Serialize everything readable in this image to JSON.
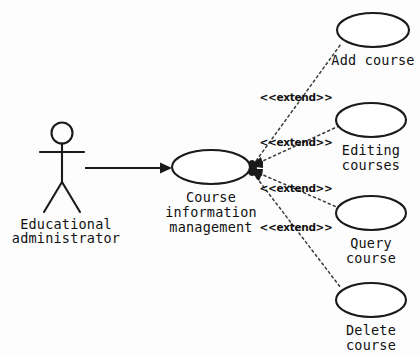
{
  "diagram": {
    "type": "uml-use-case-diagram",
    "background_color": "#fdfdfd",
    "line_color": "#1a1a1a",
    "actor": {
      "name": "educational-administrator",
      "label_line1": "Educational",
      "label_line2": "administrator",
      "x": 75,
      "y": 165
    },
    "main_use_case": {
      "name": "course-information-management",
      "label_line1": "Course",
      "label_line2": "information",
      "label_line3": "management",
      "cx": 211,
      "cy": 167,
      "rx": 39,
      "ry": 17
    },
    "extended_use_cases": [
      {
        "id": "add-course",
        "label_line1": "Add course",
        "label_line2": "",
        "cx": 373,
        "cy": 30,
        "rx": 36,
        "ry": 17,
        "stereotype": "<<extend>>",
        "stereotype_x": 296,
        "stereotype_y": 101
      },
      {
        "id": "editing-courses",
        "label_line1": "Editing",
        "label_line2": "courses",
        "cx": 371,
        "cy": 120,
        "rx": 35,
        "ry": 17,
        "stereotype": "<<extend>>",
        "stereotype_x": 296,
        "stereotype_y": 146
      },
      {
        "id": "query-course",
        "label_line1": "Query",
        "label_line2": "course",
        "cx": 371,
        "cy": 213,
        "rx": 35,
        "ry": 17,
        "stereotype": "<<extend>>",
        "stereotype_x": 296,
        "stereotype_y": 192
      },
      {
        "id": "delete-course",
        "label_line1": "Delete",
        "label_line2": "course",
        "cx": 371,
        "cy": 300,
        "rx": 35,
        "ry": 17,
        "stereotype": "<<extend>>",
        "stereotype_x": 296,
        "stereotype_y": 231
      }
    ],
    "association": {
      "name": "actor-to-main-association",
      "from_x": 85,
      "to_x": 172,
      "y": 168
    },
    "relationship_type": "extend",
    "convergence_point": {
      "x": 249,
      "y": 167
    }
  }
}
